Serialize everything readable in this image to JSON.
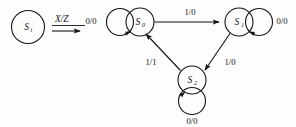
{
  "diagram": {
    "background_color": "#fdfdfd",
    "stroke_color": "#141414",
    "left_panel": {
      "state": {
        "name": "S",
        "subscript": "i"
      },
      "transform_label": "X/Z"
    },
    "right_panel": {
      "states": [
        {
          "id": "s0",
          "name": "S",
          "subscript": "0",
          "cx": 140,
          "cy": 22,
          "r": 14
        },
        {
          "id": "s1",
          "name": "S",
          "subscript": "1",
          "cx": 239,
          "cy": 22,
          "r": 14
        },
        {
          "id": "s2",
          "name": "S",
          "subscript": "2",
          "cx": 192,
          "cy": 80,
          "r": 14
        }
      ],
      "edges": [
        {
          "from": "s0",
          "to": "s0",
          "label": "0/0",
          "kind": "self-loop",
          "label_x": 99,
          "label_y": 21
        },
        {
          "from": "s1",
          "to": "s1",
          "label": "0/0",
          "kind": "self-loop",
          "label_x": 281,
          "label_y": 21
        },
        {
          "from": "s2",
          "to": "s2",
          "label": "0/0",
          "kind": "self-loop",
          "label_x": 192,
          "label_y": 122
        },
        {
          "from": "s0",
          "to": "s1",
          "label": "1/0",
          "kind": "straight",
          "label_x": 190,
          "label_y": 12
        },
        {
          "from": "s1",
          "to": "s2",
          "label": "1/0",
          "kind": "straight",
          "label_x": 228,
          "label_y": 62
        },
        {
          "from": "s2",
          "to": "s0",
          "label": "1/1",
          "kind": "straight",
          "label_x": 151,
          "label_y": 62
        }
      ]
    }
  }
}
